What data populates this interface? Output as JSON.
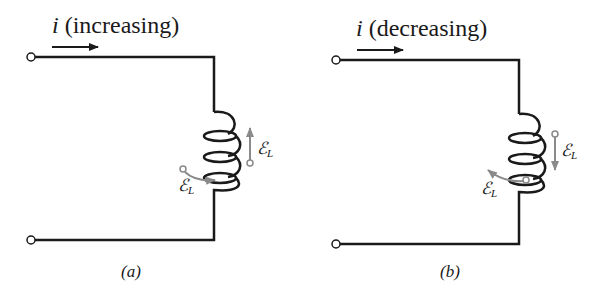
{
  "panels": [
    {
      "id": "a",
      "current_symbol": "i",
      "current_state": "(increasing)",
      "caption": "(a)",
      "emf_symbol": "ℰ",
      "emf_subscript": "L",
      "emf_direction": "up"
    },
    {
      "id": "b",
      "current_symbol": "i",
      "current_state": "(decreasing)",
      "caption": "(b)",
      "emf_symbol": "ℰ",
      "emf_subscript": "L",
      "emf_direction": "down"
    }
  ],
  "colors": {
    "wire": "#1a1a1a",
    "emf_arrow": "#8a8a8a",
    "background": "#ffffff"
  }
}
